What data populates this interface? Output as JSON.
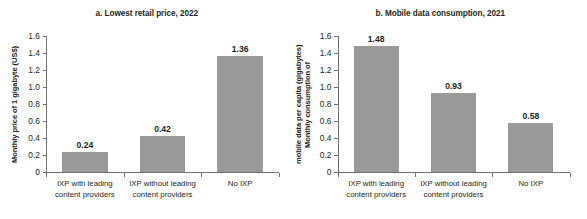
{
  "figure": {
    "panels": [
      {
        "id": "panel-a",
        "title": "a. Lowest retail price, 2022",
        "ylabel_line1": "Monthly price of 1 gigabyte (US$)",
        "ylabel_line2": "",
        "chart_data": {
          "type": "bar",
          "title": "a. Lowest retail price, 2022",
          "xlabel": "",
          "ylabel": "Monthly price of 1 gigabyte (US$)",
          "categories": [
            "IXP with leading content providers",
            "IXP without leading content providers",
            "No IXP"
          ],
          "category_lines": [
            [
              "IXP with leading",
              "content providers"
            ],
            [
              "IXP without leading",
              "content providers"
            ],
            [
              "No IXP",
              ""
            ]
          ],
          "values": [
            0.24,
            0.42,
            1.36
          ],
          "value_labels": [
            "0.24",
            "0.42",
            "1.36"
          ],
          "ylim": [
            0,
            1.6
          ],
          "yticks": [
            0,
            0.2,
            0.4,
            0.6,
            0.8,
            1.0,
            1.2,
            1.4,
            1.6
          ],
          "ytick_labels": [
            "0",
            "0.2",
            "0.4",
            "0.6",
            "0.8",
            "1.0",
            "1.2",
            "1.4",
            "1.6"
          ],
          "grid": false,
          "legend": null,
          "bar_color": "#9a9a9a"
        }
      },
      {
        "id": "panel-b",
        "title": "b. Mobile data consumption, 2021",
        "ylabel_line1": "Monthly consumption of",
        "ylabel_line2": "mobile data per capita (gigabytes)",
        "chart_data": {
          "type": "bar",
          "title": "b. Mobile data consumption, 2021",
          "xlabel": "",
          "ylabel": "Monthly consumption of mobile data per capita (gigabytes)",
          "categories": [
            "IXP with leading content providers",
            "IXP without leading content providers",
            "No IXP"
          ],
          "category_lines": [
            [
              "IXP with leading",
              "content providers"
            ],
            [
              "IXP without leading",
              "content providers"
            ],
            [
              "No IXP",
              ""
            ]
          ],
          "values": [
            1.48,
            0.93,
            0.58
          ],
          "value_labels": [
            "1.48",
            "0.93",
            "0.58"
          ],
          "ylim": [
            0,
            1.6
          ],
          "yticks": [
            0,
            0.2,
            0.4,
            0.6,
            0.8,
            1.0,
            1.2,
            1.4,
            1.6
          ],
          "ytick_labels": [
            "0",
            "0.2",
            "0.4",
            "0.6",
            "0.8",
            "1.0",
            "1.2",
            "1.4",
            "1.6"
          ],
          "grid": false,
          "legend": null,
          "bar_color": "#9a9a9a"
        }
      }
    ],
    "colors": {
      "bar": "#9a9a9a",
      "axis": "#6d6e71",
      "text": "#231f20",
      "background": "#ffffff"
    }
  }
}
